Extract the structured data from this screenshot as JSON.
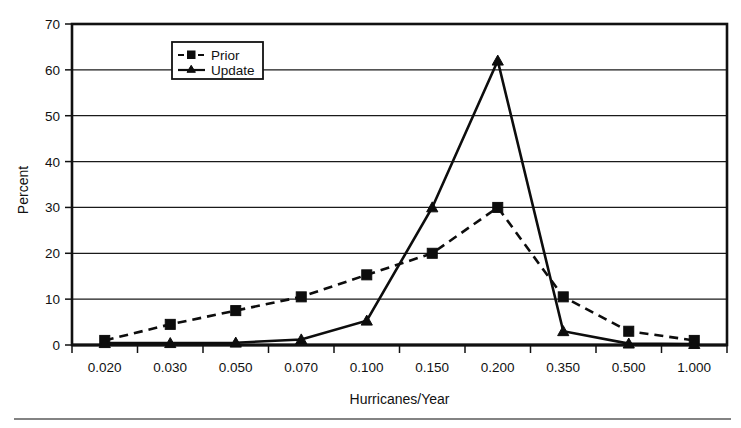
{
  "figure": {
    "background_color": "#ffffff",
    "ink_color": "#0d0d0d",
    "page_rule_color": "#5a5a5a"
  },
  "chart_data": {
    "type": "line",
    "title": "",
    "xlabel": "Hurricanes/Year",
    "ylabel": "Percent",
    "categories": [
      "0.020",
      "0.030",
      "0.050",
      "0.070",
      "0.100",
      "0.150",
      "0.200",
      "0.350",
      "0.500",
      "1.000"
    ],
    "ylim": [
      0,
      70
    ],
    "yticks": [
      0,
      10,
      20,
      30,
      40,
      50,
      60,
      70
    ],
    "grid": true,
    "grid_axis": "y",
    "legend_position": "upper-center-left",
    "series": [
      {
        "name": "Prior",
        "marker": "square",
        "linestyle": "dashed",
        "color": "#0d0d0d",
        "values": [
          1.0,
          4.5,
          7.5,
          10.5,
          15.3,
          20.0,
          30.0,
          10.5,
          3.0,
          1.0
        ]
      },
      {
        "name": "Update",
        "marker": "triangle",
        "linestyle": "solid",
        "color": "#0d0d0d",
        "values": [
          0.4,
          0.4,
          0.5,
          1.2,
          5.3,
          30.0,
          62.0,
          3.0,
          0.3,
          0.2
        ]
      }
    ]
  },
  "legend": {
    "entries": [
      {
        "label": "Prior"
      },
      {
        "label": "Update"
      }
    ]
  },
  "axes": {
    "y_tick_labels": [
      "0",
      "10",
      "20",
      "30",
      "40",
      "50",
      "60",
      "70"
    ],
    "x_tick_labels": [
      "0.020",
      "0.030",
      "0.050",
      "0.070",
      "0.100",
      "0.150",
      "0.200",
      "0.350",
      "0.500",
      "1.000"
    ],
    "y_axis_title": "Percent",
    "x_axis_title": "Hurricanes/Year"
  }
}
